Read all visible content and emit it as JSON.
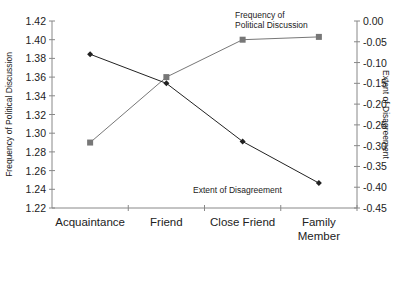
{
  "chart_data": {
    "type": "line",
    "title": "",
    "categories": [
      "Acquaintance",
      "Friend",
      "Close Friend",
      "Family Member"
    ],
    "category_lines": [
      [
        "Acquaintance"
      ],
      [
        "Friend"
      ],
      [
        "Close Friend"
      ],
      [
        "Family",
        "Member"
      ]
    ],
    "series": [
      {
        "name": "Frequency of Political Discussion",
        "label_lines": [
          "Frequency of",
          "Political Discussion"
        ],
        "axis": "left",
        "marker": "square",
        "color": "#777777",
        "values": [
          1.29,
          1.36,
          1.4,
          1.403
        ]
      },
      {
        "name": "Extent of Disagreement",
        "label_lines": [
          "Extent of Disagreement"
        ],
        "axis": "right",
        "marker": "diamond",
        "color": "#222222",
        "values": [
          -0.08,
          -0.15,
          -0.29,
          -0.39
        ]
      }
    ],
    "ylabel": "Frequency of Political Discussion",
    "ylabel_right": "Extent of Disagreement",
    "xlabel": "",
    "ylim": [
      1.22,
      1.42
    ],
    "yticks": [
      "1.42",
      "1.40",
      "1.38",
      "1.36",
      "1.34",
      "1.32",
      "1.30",
      "1.28",
      "1.26",
      "1.24",
      "1.22"
    ],
    "ylim_right": [
      -0.45,
      0.0
    ],
    "yticks_right": [
      "0.00",
      "-0.05",
      "-0.10",
      "-0.15",
      "-0.20",
      "-0.25",
      "-0.30",
      "-0.35",
      "-0.40",
      "-0.45"
    ],
    "grid": false,
    "legend": "inline-labels"
  }
}
